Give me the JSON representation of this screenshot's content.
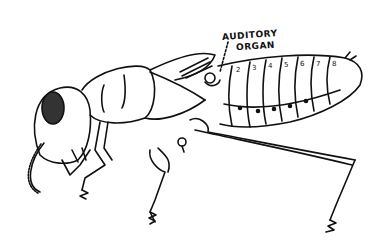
{
  "figure": {
    "annotations": [
      {
        "text_line1": "AUDITORY",
        "text_line2": "ORGAN"
      }
    ],
    "abdomen_segment_numbers": [
      "2",
      "3",
      "4",
      "5",
      "6",
      "7",
      "8"
    ],
    "colors": {
      "ink": "#111111",
      "background": "#ffffff"
    }
  }
}
